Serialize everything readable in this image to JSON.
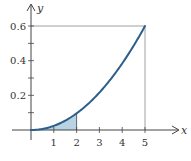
{
  "chart_data": {
    "type": "area",
    "title": "",
    "xlabel": "x",
    "ylabel": "y",
    "xlim": [
      0,
      5
    ],
    "ylim": [
      0,
      0.6
    ],
    "x_ticks": [
      1,
      2,
      3,
      4,
      5
    ],
    "x_tick_labels": [
      "1",
      "2",
      "3",
      "4",
      "5"
    ],
    "y_ticks": [
      0.1,
      0.2,
      0.3,
      0.4,
      0.5,
      0.6
    ],
    "y_tick_labels": [
      "",
      "0.2",
      "",
      "0.4",
      "",
      "0.6"
    ],
    "grid": false,
    "series": [
      {
        "name": "curve",
        "x": [
          0,
          0.5,
          1,
          1.5,
          2,
          2.5,
          3,
          3.5,
          4,
          4.5,
          5
        ],
        "y": [
          0,
          0.006,
          0.024,
          0.054,
          0.096,
          0.15,
          0.216,
          0.294,
          0.384,
          0.486,
          0.6
        ]
      }
    ],
    "shaded_region": {
      "x_from": 0,
      "x_to": 2,
      "under": "curve"
    },
    "reference_lines": [
      {
        "type": "horizontal",
        "y": 0.6,
        "x_from": 0,
        "x_to": 5
      },
      {
        "type": "vertical",
        "x": 5,
        "y_from": 0,
        "y_to": 0.6
      }
    ],
    "colors": {
      "curve": "#2e5f8a",
      "shade": "#b8d3e3",
      "axes": "#444444",
      "reference": "#888888"
    }
  }
}
